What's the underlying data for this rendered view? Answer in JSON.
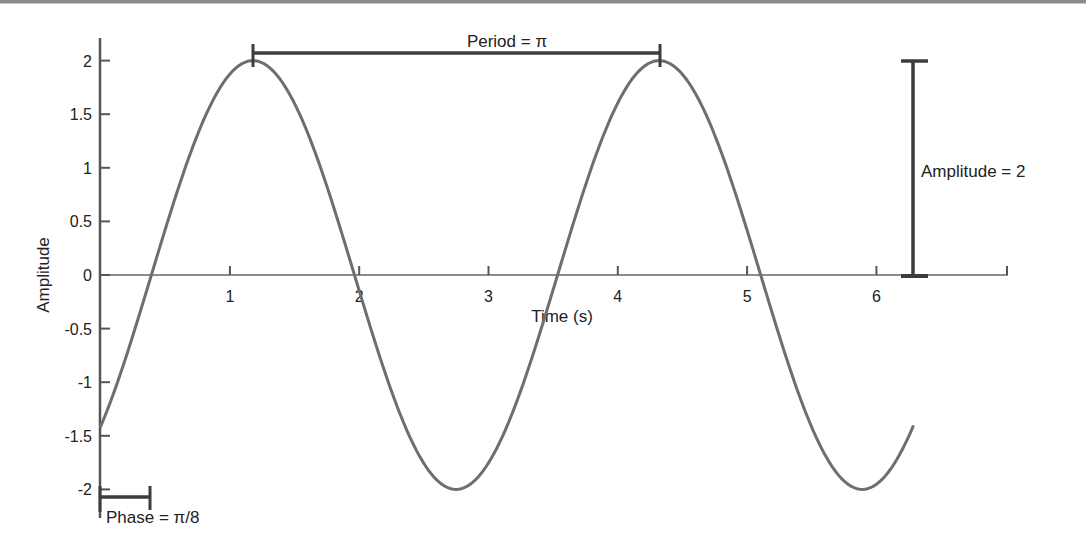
{
  "chart_data": {
    "type": "line",
    "title": "",
    "xlabel": "Time (s)",
    "ylabel": "Amplitude",
    "xlim": [
      0,
      7
    ],
    "ylim": [
      -2.2,
      2.2
    ],
    "x_ticks": [
      1,
      2,
      3,
      4,
      5,
      6
    ],
    "x_tick_labels": [
      "1",
      "2",
      "3",
      "4",
      "5",
      "6"
    ],
    "y_ticks": [
      2,
      1.5,
      1,
      0.5,
      0,
      -0.5,
      -1,
      -1.5,
      -2
    ],
    "y_tick_labels": [
      "2",
      "1.5",
      "1",
      "0.5",
      "0",
      "-0.5",
      "-1",
      "-1.5",
      "-2"
    ],
    "grid": false,
    "legend": null,
    "series": [
      {
        "name": "y = 2 sin(2(t − π/8))",
        "function": "2*sin(2*(t - pi/8))",
        "amplitude": 2,
        "angular_frequency": 2,
        "phase": 0.3927,
        "t_range": [
          0,
          6.2832
        ],
        "x": [
          0,
          0.3927,
          0.7854,
          1.1781,
          1.5708,
          1.9635,
          2.3562,
          2.7489,
          3.1416,
          3.5343,
          3.927,
          4.3197,
          4.7124,
          5.1051,
          5.4978,
          5.8905,
          6.2832
        ],
        "values": [
          -1.414,
          0,
          1.414,
          2,
          1.414,
          0,
          -1.414,
          -2,
          -1.414,
          0,
          1.414,
          2,
          1.414,
          0,
          -1.414,
          -2,
          -1.414
        ],
        "color": "#6e6e6e"
      }
    ],
    "annotations": [
      {
        "text": "Period = π",
        "type": "horizontal-bracket",
        "from_x": 1.1781,
        "to_x": 4.3197,
        "y": 2.05
      },
      {
        "text": "Amplitude = 2",
        "type": "vertical-bracket",
        "x": 6.3,
        "from_y": 0,
        "to_y": 2
      },
      {
        "text": "Phase = π/8",
        "type": "horizontal-bracket",
        "from_x": 0,
        "to_x": 0.3927,
        "y": -2.1
      }
    ]
  },
  "labels": {
    "xlabel": "Time (s)",
    "ylabel": "Amplitude",
    "period": "Period = π",
    "amplitude": "Amplitude = 2",
    "phase": "Phase = π/8"
  },
  "colors": {
    "curve": "#6e6e6e",
    "axis": "#555555",
    "bracket": "#3c3c3c",
    "text": "#222222"
  }
}
